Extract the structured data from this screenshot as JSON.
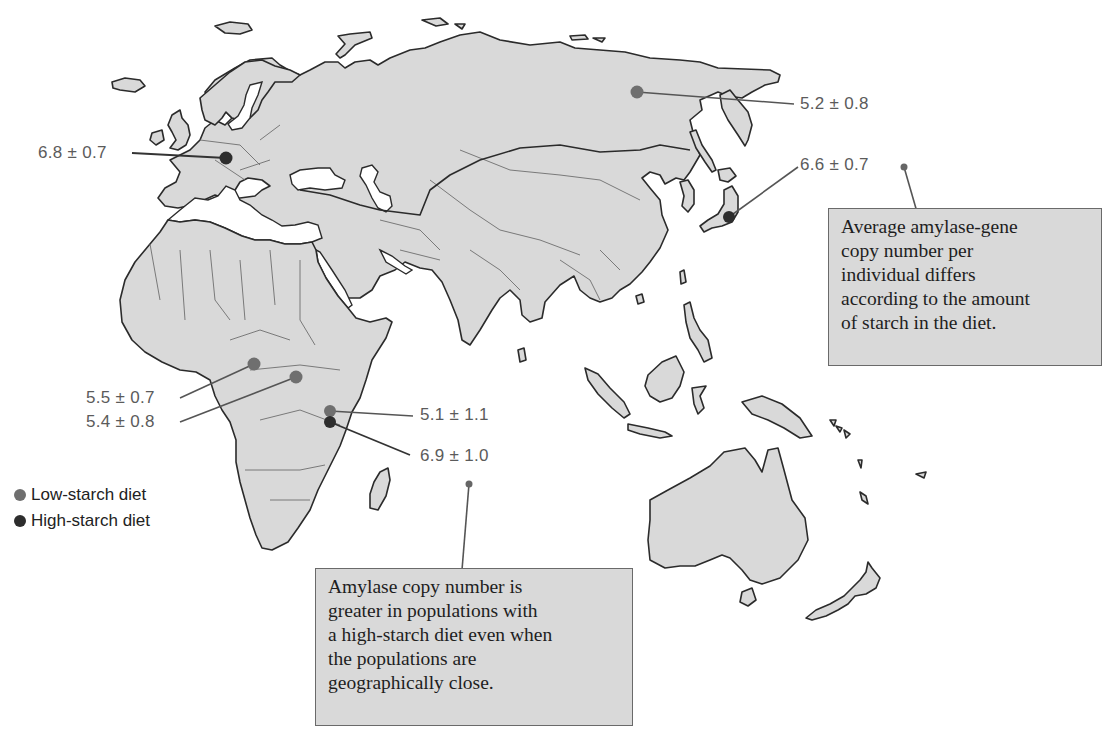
{
  "figure": {
    "type": "thematic-map",
    "region": "Europe, Asia, Africa, Oceania"
  },
  "colors": {
    "land": "#d9d9d9",
    "coast": "#2b2b2b",
    "low_starch": "#6f6f6f",
    "high_starch": "#2d2d2d",
    "box_fill": "#d9d9d9"
  },
  "legend": {
    "items": [
      {
        "label": "Low-starch diet",
        "color": "#6f6f6f"
      },
      {
        "label": "High-starch diet",
        "color": "#2d2d2d"
      }
    ]
  },
  "populations": [
    {
      "value": "6.8 ± 0.7",
      "diet": "high",
      "region": "Central Europe"
    },
    {
      "value": "5.2 ± 0.8",
      "diet": "low",
      "region": "Siberia"
    },
    {
      "value": "6.6 ± 0.7",
      "diet": "high",
      "region": "Japan"
    },
    {
      "value": "5.5 ± 0.7",
      "diet": "low",
      "region": "West-Central Africa"
    },
    {
      "value": "5.4 ± 0.8",
      "diet": "low",
      "region": "Central Africa"
    },
    {
      "value": "5.1 ± 1.1",
      "diet": "low",
      "region": "East Africa"
    },
    {
      "value": "6.9 ± 1.0",
      "diet": "high",
      "region": "East Africa"
    }
  ],
  "notes": {
    "top_right": {
      "lines": [
        "Average amylase-gene",
        "copy number per",
        "individual differs",
        "according to the amount",
        "of starch in the diet."
      ]
    },
    "bottom": {
      "lines": [
        "Amylase copy number is",
        "greater in populations with",
        "a high-starch diet even when",
        "the populations are",
        "geographically close."
      ]
    }
  }
}
